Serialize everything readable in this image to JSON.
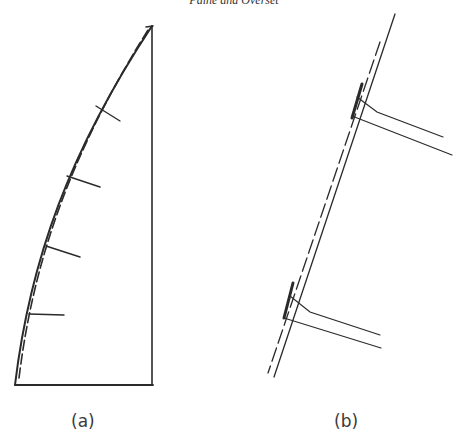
{
  "header": {
    "running_title": "Paine and Overset"
  },
  "figures": [
    {
      "id": "a",
      "caption": "(a)",
      "description": "Curved wall with dashed deformed profile and four normal tick marks inside a vertical-sided enclosure"
    },
    {
      "id": "b",
      "caption": "(b)",
      "description": "Close-up of inclined wall showing double dashed line with two pairs of attached diverging members"
    }
  ],
  "colors": {
    "ink": "#2a2a2a",
    "background": "#ffffff"
  }
}
